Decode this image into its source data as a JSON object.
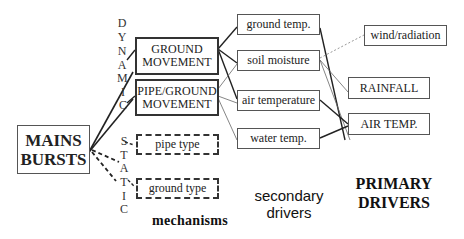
{
  "root": {
    "line1": "MAINS",
    "line2": "BURSTS"
  },
  "categories": {
    "dynamic": [
      "D",
      "Y",
      "N",
      "A",
      "M",
      "I",
      "C"
    ],
    "static": [
      "S",
      "T",
      "A",
      "T",
      "I",
      "C"
    ]
  },
  "mechanisms": {
    "ground_movement": {
      "line1": "GROUND",
      "line2": "MOVEMENT"
    },
    "pipe_ground_movement": {
      "line1": "PIPE/GROUND",
      "line2": "MOVEMENT"
    },
    "pipe_type": "pipe type",
    "ground_type": "ground type"
  },
  "secondary": {
    "ground_temp": "ground temp.",
    "soil_moisture": "soil moisture",
    "air_temperature": "air temperature",
    "water_temp": "water temp."
  },
  "primary": {
    "wind_radiation": "wind/radiation",
    "rainfall": "RAINFALL",
    "air_temp": "AIR TEMP."
  },
  "labels": {
    "mechanisms": "mechanisms",
    "secondary_line1": "secondary",
    "secondary_line2": "drivers",
    "primary_line1": "PRIMARY",
    "primary_line2": "DRIVERS"
  },
  "colors": {
    "line": "#222222",
    "thin_line": "#666666",
    "dotted_line": "#999999"
  }
}
